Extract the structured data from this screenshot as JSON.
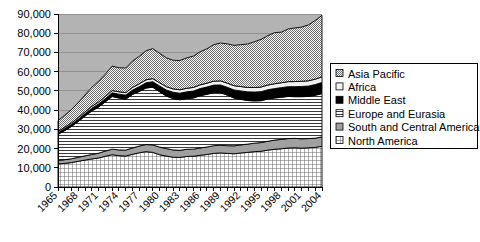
{
  "chart_data": {
    "type": "area",
    "title": "",
    "subtitle": "",
    "xlabel": "",
    "ylabel": "",
    "stacked": true,
    "grid": true,
    "legend_position": "right",
    "xlim": [
      1965,
      2004
    ],
    "ylim": [
      0,
      90000
    ],
    "yticks": [
      0,
      10000,
      20000,
      30000,
      40000,
      50000,
      60000,
      70000,
      80000,
      90000
    ],
    "ytick_labels": [
      "0",
      "10,000",
      "20,000",
      "30,000",
      "40,000",
      "50,000",
      "60,000",
      "70,000",
      "80,000",
      "90,000"
    ],
    "xticks": [
      1965,
      1968,
      1971,
      1974,
      1977,
      1980,
      1983,
      1986,
      1989,
      1992,
      1995,
      1998,
      2001,
      2004
    ],
    "xtick_labels": [
      "1965",
      "1968",
      "1971",
      "1974",
      "1977",
      "1980",
      "1983",
      "1986",
      "1989",
      "1992",
      "1995",
      "1998",
      "2001",
      "2004"
    ],
    "x": [
      1965,
      1966,
      1967,
      1968,
      1969,
      1970,
      1971,
      1972,
      1973,
      1974,
      1975,
      1976,
      1977,
      1978,
      1979,
      1980,
      1981,
      1982,
      1983,
      1984,
      1985,
      1986,
      1987,
      1988,
      1989,
      1990,
      1991,
      1992,
      1993,
      1994,
      1995,
      1996,
      1997,
      1998,
      1999,
      2000,
      2001,
      2002,
      2003,
      2004
    ],
    "series": [
      {
        "name": "North America",
        "pattern": "grid-crosshatch",
        "values": [
          12000,
          12300,
          12700,
          13400,
          14000,
          14600,
          15100,
          16000,
          16800,
          16300,
          16100,
          17000,
          17800,
          18400,
          18000,
          16800,
          16100,
          15500,
          15400,
          15900,
          16000,
          16500,
          16900,
          17500,
          17700,
          17500,
          17300,
          17700,
          18000,
          18400,
          18600,
          19200,
          19600,
          19900,
          20300,
          20400,
          20200,
          20400,
          20600,
          21200
        ]
      },
      {
        "name": "South and Central America",
        "pattern": "solid-gray",
        "values": [
          1800,
          1900,
          2000,
          2100,
          2200,
          2300,
          2500,
          2700,
          2900,
          3000,
          3100,
          3300,
          3500,
          3700,
          3900,
          4000,
          3900,
          3800,
          3700,
          3700,
          3700,
          3800,
          3900,
          4000,
          4000,
          4000,
          4100,
          4200,
          4300,
          4400,
          4500,
          4600,
          4800,
          4900,
          4900,
          4900,
          4900,
          4800,
          4800,
          4900
        ]
      },
      {
        "name": "Europe and Eurasia",
        "pattern": "horizontal-lines",
        "values": [
          13500,
          15200,
          16800,
          18600,
          20700,
          22700,
          24000,
          25600,
          27400,
          27000,
          26500,
          27800,
          28400,
          29400,
          30000,
          28800,
          27300,
          26700,
          26300,
          26400,
          26600,
          27200,
          27400,
          27600,
          27400,
          26300,
          24900,
          23700,
          22700,
          22000,
          21800,
          22000,
          21900,
          21900,
          21900,
          21700,
          21900,
          21900,
          22300,
          22500
        ]
      },
      {
        "name": "Middle East",
        "pattern": "solid-black",
        "values": [
          900,
          1000,
          1100,
          1200,
          1300,
          1400,
          1600,
          1700,
          1900,
          2000,
          2100,
          2300,
          2500,
          2700,
          2900,
          3000,
          3200,
          3300,
          3400,
          3500,
          3600,
          3700,
          3800,
          3900,
          4000,
          4100,
          4200,
          4400,
          4500,
          4600,
          4700,
          4800,
          4900,
          5000,
          5100,
          5200,
          5300,
          5400,
          5600,
          5800
        ]
      },
      {
        "name": "Africa",
        "pattern": "white-light",
        "values": [
          700,
          750,
          800,
          850,
          900,
          1000,
          1050,
          1100,
          1200,
          1250,
          1300,
          1400,
          1450,
          1550,
          1600,
          1650,
          1700,
          1750,
          1800,
          1850,
          1900,
          1950,
          2000,
          2050,
          2100,
          2150,
          2200,
          2250,
          2300,
          2350,
          2400,
          2450,
          2500,
          2550,
          2600,
          2650,
          2700,
          2750,
          2800,
          2900
        ]
      },
      {
        "name": "Asia Pacific",
        "pattern": "fine-checker",
        "values": [
          5600,
          6200,
          6900,
          7800,
          8800,
          9900,
          10700,
          11600,
          12700,
          12500,
          12800,
          13700,
          14300,
          15100,
          15600,
          15300,
          15000,
          14900,
          15200,
          15800,
          16300,
          17200,
          17900,
          19000,
          19700,
          20400,
          21000,
          21800,
          22600,
          23800,
          24800,
          25700,
          26600,
          26300,
          27400,
          27900,
          28200,
          29100,
          30500,
          32000
        ]
      }
    ]
  },
  "legend": {
    "items": [
      {
        "label": "Asia Pacific",
        "swatch": "fine-checker"
      },
      {
        "label": "Africa",
        "swatch": "white-light"
      },
      {
        "label": "Middle East",
        "swatch": "solid-black"
      },
      {
        "label": "Europe and Eurasia",
        "swatch": "horizontal-lines"
      },
      {
        "label": "South and Central America",
        "swatch": "solid-gray"
      },
      {
        "label": "North America",
        "swatch": "grid-crosshatch"
      }
    ]
  },
  "colors": {
    "plot_background": "#b3b3b3",
    "axis": "#000000",
    "gridline": "#888888",
    "middle_east": "#000000",
    "south_central_america": "#a0a0a0",
    "legend_background": "#ffffff",
    "text": "#000000"
  }
}
